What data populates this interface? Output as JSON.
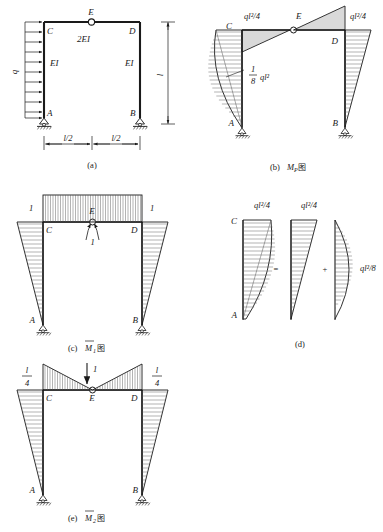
{
  "figure": {
    "title": "",
    "panels": [
      {
        "id": "a",
        "caption": "(a)",
        "name": "frame-structure",
        "labels": {
          "load": "q",
          "joint_C": "C",
          "joint_D": "D",
          "joint_E": "E",
          "joint_A": "A",
          "joint_B": "B",
          "stiffness_beam": "2EI",
          "stiffness_left_col": "EI",
          "stiffness_right_col": "EI",
          "dim_height": "l",
          "dim_left": "l/2",
          "dim_right": "l/2"
        }
      },
      {
        "id": "b",
        "caption_prefix": "(b)",
        "caption_symbol": "M",
        "caption_sub": "P",
        "caption_cjk": "图",
        "name": "mp-moment-diagram",
        "labels": {
          "joint_C": "C",
          "joint_D": "D",
          "joint_E": "E",
          "joint_A": "A",
          "joint_B": "B",
          "left_top_value": "ql²/4",
          "right_top_value": "ql²/4",
          "mid_value_num": "1",
          "mid_value_den": "8",
          "mid_value_expr": "ql²"
        }
      },
      {
        "id": "c",
        "caption_prefix": "(c)",
        "caption_symbol": "M",
        "caption_sub": "1",
        "caption_cjk": "图",
        "name": "m1-unit-moment-diagram",
        "labels": {
          "joint_C": "C",
          "joint_D": "D",
          "joint_E": "E",
          "joint_A": "A",
          "joint_B": "B",
          "left_value": "1",
          "right_value": "1",
          "unit_pair": "1"
        }
      },
      {
        "id": "d",
        "caption": "(d)",
        "name": "decomposition-diagram",
        "labels": {
          "joint_C": "C",
          "joint_A": "A",
          "first_value": "ql²/4",
          "second_value": "ql²/4",
          "third_value": "ql²/8",
          "equals": "=",
          "plus": "+"
        }
      },
      {
        "id": "e",
        "caption_prefix": "(e)",
        "caption_symbol": "M",
        "caption_sub": "2",
        "caption_cjk": "图",
        "name": "m2-unit-force-diagram",
        "labels": {
          "joint_C": "C",
          "joint_D": "D",
          "joint_E": "E",
          "joint_A": "A",
          "joint_B": "B",
          "left_num": "l",
          "left_den": "4",
          "right_num": "l",
          "right_den": "4",
          "unit_force": "1"
        }
      }
    ]
  },
  "colors": {
    "ink": "#1a1a1a",
    "hatch": "#555555",
    "background": "#ffffff"
  }
}
